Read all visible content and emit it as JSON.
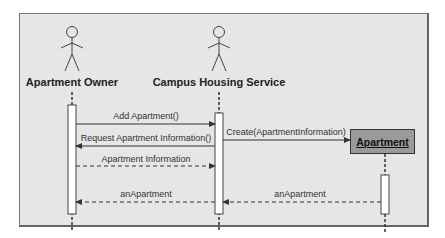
{
  "diagram": {
    "type": "UML sequence diagram",
    "lifelines": [
      {
        "id": "owner",
        "label": "Apartment Owner",
        "kind": "actor"
      },
      {
        "id": "service",
        "label": "Campus Housing Service",
        "kind": "actor"
      },
      {
        "id": "apartment",
        "label": "Apartment",
        "kind": "object"
      }
    ],
    "messages": [
      {
        "from": "owner",
        "to": "service",
        "label": "Add Apartment()",
        "style": "solid"
      },
      {
        "from": "service",
        "to": "owner",
        "label": "Request Apartment Information()",
        "style": "solid"
      },
      {
        "from": "service",
        "to": "apartment",
        "label": "Create(ApartmentInformation)",
        "style": "solid"
      },
      {
        "from": "owner",
        "to": "service",
        "label": "Apartment Information",
        "style": "dashed"
      },
      {
        "from": "apartment",
        "to": "service",
        "label": "anApartment",
        "style": "dashed"
      },
      {
        "from": "service",
        "to": "owner",
        "label": "anApartment",
        "style": "dashed"
      }
    ]
  },
  "labels": {
    "owner": "Apartment Owner",
    "service": "Campus Housing Service",
    "apartment": "Apartment",
    "m1": "Add Apartment()",
    "m2": "Request Apartment Information()",
    "m3": "Create(ApartmentInformation)",
    "m4": "Apartment Information",
    "m5": "anApartment",
    "m6": "anApartment"
  }
}
